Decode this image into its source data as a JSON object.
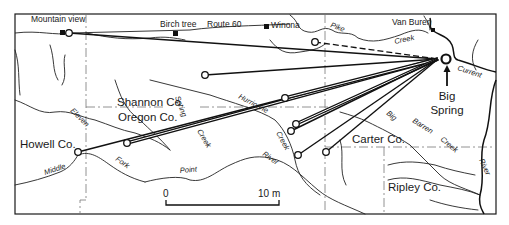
{
  "map": {
    "towns": [
      {
        "name": "Mountain view"
      },
      {
        "name": "Birch tree"
      },
      {
        "name": "Winona"
      },
      {
        "name": "Van Buren"
      }
    ],
    "road": {
      "label": "Route 60"
    },
    "counties": [
      {
        "name": "Shannon Co."
      },
      {
        "name": "Oregon Co."
      },
      {
        "name": "Howell Co."
      },
      {
        "name": "Carter Co."
      },
      {
        "name": "Ripley Co."
      }
    ],
    "streams": {
      "pike": "Pike",
      "creek_north": "Creek",
      "current": "Current",
      "eleven": "Eleven",
      "spring": "Spring",
      "creek_spring": "Creek",
      "hurricane": "Hurricane",
      "creek_hurricane": "Creek",
      "middle": "Middle",
      "fork": "Fork",
      "point": "Point",
      "river_eleven_point": "River",
      "big": "Big",
      "barren": "Barren",
      "creek_barren": "Creek",
      "river_current": "River"
    },
    "spring": {
      "line1": "Big",
      "line2": "Spring"
    },
    "scale": {
      "zero": "0",
      "end": "10 m"
    },
    "colors": {
      "ink": "#111111",
      "county_line": "#777777",
      "background": "#ffffff"
    }
  }
}
